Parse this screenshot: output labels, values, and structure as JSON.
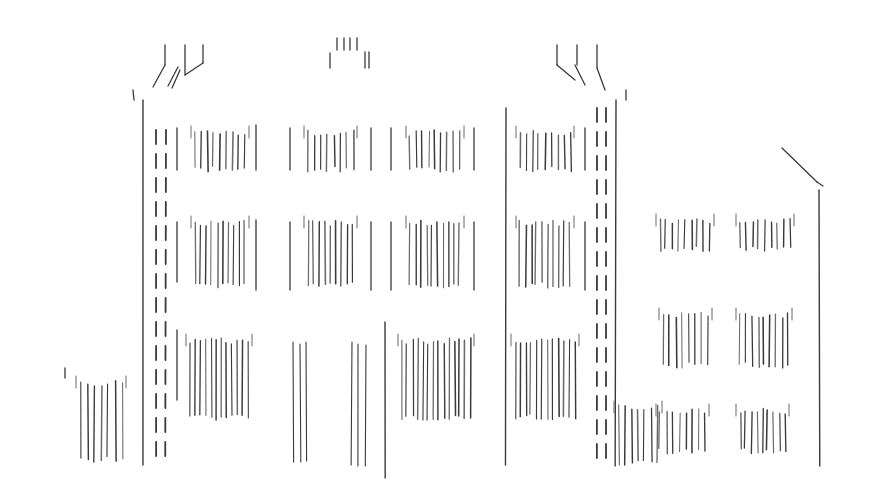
{
  "image": {
    "subject": "Pencil line sketch of a building facade",
    "width": 872,
    "height": 502,
    "background": "#ffffff",
    "stroke_color": "#3a3a3a",
    "light_stroke_color": "#6a6a6a"
  },
  "pillars": [
    {
      "name": "left-tower-edge",
      "x": 143,
      "y1": 100,
      "y2": 465,
      "dashed": false
    },
    {
      "name": "left-tower-dash-a",
      "x": 156,
      "y1": 130,
      "y2": 460,
      "dashed": true
    },
    {
      "name": "left-tower-dash-b",
      "x": 166,
      "y1": 130,
      "y2": 462,
      "dashed": true
    },
    {
      "name": "center-left-tower-edge",
      "x": 506,
      "y1": 108,
      "y2": 465,
      "dashed": false
    },
    {
      "name": "right-tower-dash-a",
      "x": 597,
      "y1": 108,
      "y2": 462,
      "dashed": true
    },
    {
      "name": "right-tower-dash-b",
      "x": 606,
      "y1": 108,
      "y2": 462,
      "dashed": true
    },
    {
      "name": "right-tower-edge",
      "x": 616,
      "y1": 100,
      "y2": 466,
      "dashed": false
    },
    {
      "name": "right-wing-edge",
      "x": 819,
      "y1": 190,
      "y2": 466,
      "dashed": false
    },
    {
      "name": "center-door-line",
      "x": 385,
      "y1": 322,
      "y2": 478,
      "dashed": false
    }
  ],
  "windows": [
    {
      "x": 195,
      "y": 130,
      "w": 50,
      "h": 42,
      "n": 9
    },
    {
      "x": 308,
      "y": 130,
      "w": 45,
      "h": 42,
      "n": 8
    },
    {
      "x": 410,
      "y": 130,
      "w": 50,
      "h": 42,
      "n": 9
    },
    {
      "x": 520,
      "y": 130,
      "w": 50,
      "h": 42,
      "n": 9
    },
    {
      "x": 195,
      "y": 220,
      "w": 50,
      "h": 68,
      "n": 10
    },
    {
      "x": 308,
      "y": 220,
      "w": 45,
      "h": 68,
      "n": 9
    },
    {
      "x": 410,
      "y": 220,
      "w": 50,
      "h": 68,
      "n": 10
    },
    {
      "x": 520,
      "y": 220,
      "w": 50,
      "h": 68,
      "n": 10
    },
    {
      "x": 190,
      "y": 338,
      "w": 58,
      "h": 82,
      "n": 12
    },
    {
      "x": 402,
      "y": 338,
      "w": 68,
      "h": 82,
      "n": 14
    },
    {
      "x": 515,
      "y": 338,
      "w": 60,
      "h": 82,
      "n": 12
    },
    {
      "x": 80,
      "y": 380,
      "w": 42,
      "h": 82,
      "n": 7
    },
    {
      "x": 660,
      "y": 218,
      "w": 50,
      "h": 34,
      "n": 9
    },
    {
      "x": 740,
      "y": 218,
      "w": 50,
      "h": 34,
      "n": 9
    },
    {
      "x": 663,
      "y": 312,
      "w": 45,
      "h": 56,
      "n": 8
    },
    {
      "x": 740,
      "y": 312,
      "w": 48,
      "h": 56,
      "n": 9
    },
    {
      "x": 660,
      "y": 408,
      "w": 45,
      "h": 46,
      "n": 8
    },
    {
      "x": 740,
      "y": 408,
      "w": 45,
      "h": 46,
      "n": 9
    },
    {
      "x": 618,
      "y": 405,
      "w": 40,
      "h": 60,
      "n": 7
    }
  ],
  "door_strokes": [
    {
      "x": 293,
      "y1": 342,
      "y2": 462
    },
    {
      "x": 300,
      "y1": 344,
      "y2": 462
    },
    {
      "x": 306,
      "y1": 342,
      "y2": 461
    },
    {
      "x": 352,
      "y1": 342,
      "y2": 465
    },
    {
      "x": 358,
      "y1": 344,
      "y2": 466
    },
    {
      "x": 366,
      "y1": 345,
      "y2": 466
    }
  ],
  "side_strokes": [
    {
      "x": 177,
      "y1": 128,
      "y2": 170
    },
    {
      "x": 177,
      "y1": 222,
      "y2": 282
    },
    {
      "x": 177,
      "y1": 330,
      "y2": 400
    },
    {
      "x": 256,
      "y1": 125,
      "y2": 170
    },
    {
      "x": 256,
      "y1": 220,
      "y2": 290
    },
    {
      "x": 290,
      "y1": 128,
      "y2": 170
    },
    {
      "x": 290,
      "y1": 222,
      "y2": 290
    },
    {
      "x": 371,
      "y1": 128,
      "y2": 170
    },
    {
      "x": 371,
      "y1": 222,
      "y2": 290
    },
    {
      "x": 391,
      "y1": 128,
      "y2": 170
    },
    {
      "x": 391,
      "y1": 222,
      "y2": 290
    },
    {
      "x": 474,
      "y1": 128,
      "y2": 170
    },
    {
      "x": 474,
      "y1": 222,
      "y2": 290
    },
    {
      "x": 585,
      "y1": 128,
      "y2": 170
    },
    {
      "x": 585,
      "y1": 222,
      "y2": 290
    }
  ],
  "roof_strokes": [
    {
      "x1": 165,
      "y1": 45,
      "x2": 165,
      "y2": 65
    },
    {
      "x1": 165,
      "y1": 65,
      "x2": 153,
      "y2": 87
    },
    {
      "x1": 185,
      "y1": 45,
      "x2": 185,
      "y2": 75
    },
    {
      "x1": 185,
      "y1": 75,
      "x2": 203,
      "y2": 63
    },
    {
      "x1": 203,
      "y1": 45,
      "x2": 203,
      "y2": 63
    },
    {
      "x1": 178,
      "y1": 67,
      "x2": 168,
      "y2": 86
    },
    {
      "x1": 180,
      "y1": 70,
      "x2": 172,
      "y2": 88
    },
    {
      "x1": 337,
      "y1": 38,
      "x2": 337,
      "y2": 50
    },
    {
      "x1": 344,
      "y1": 38,
      "x2": 344,
      "y2": 50
    },
    {
      "x1": 350,
      "y1": 38,
      "x2": 350,
      "y2": 50
    },
    {
      "x1": 357,
      "y1": 38,
      "x2": 357,
      "y2": 50
    },
    {
      "x1": 330,
      "y1": 53,
      "x2": 330,
      "y2": 68
    },
    {
      "x1": 365,
      "y1": 52,
      "x2": 365,
      "y2": 68
    },
    {
      "x1": 369,
      "y1": 52,
      "x2": 369,
      "y2": 68
    },
    {
      "x1": 557,
      "y1": 45,
      "x2": 557,
      "y2": 65
    },
    {
      "x1": 557,
      "y1": 65,
      "x2": 575,
      "y2": 80
    },
    {
      "x1": 577,
      "y1": 45,
      "x2": 577,
      "y2": 65
    },
    {
      "x1": 575,
      "y1": 65,
      "x2": 585,
      "y2": 85
    },
    {
      "x1": 597,
      "y1": 45,
      "x2": 597,
      "y2": 68
    },
    {
      "x1": 597,
      "y1": 68,
      "x2": 605,
      "y2": 90
    },
    {
      "x1": 782,
      "y1": 148,
      "x2": 817,
      "y2": 182
    },
    {
      "x1": 817,
      "y1": 182,
      "x2": 823,
      "y2": 186
    },
    {
      "x1": 133,
      "y1": 90,
      "x2": 134,
      "y2": 100
    },
    {
      "x1": 626,
      "y1": 90,
      "x2": 626,
      "y2": 100
    },
    {
      "x1": 65,
      "y1": 368,
      "x2": 65,
      "y2": 378
    }
  ]
}
